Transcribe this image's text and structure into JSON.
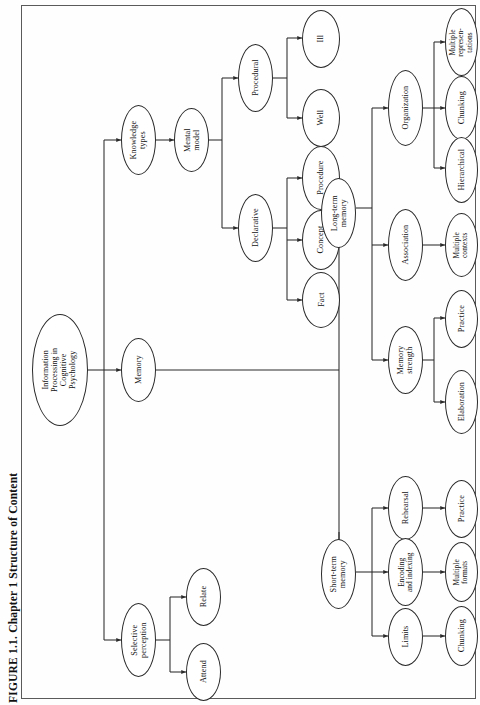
{
  "figure": {
    "caption": "FIGURE 1.1.  Chapter 1 Structure of Content",
    "type": "tree-diagram",
    "orientation": "rotated-90-counterclockwise",
    "node_shape": "ellipse",
    "colors": {
      "stroke": "#2a2a2a",
      "fill": "#ffffff",
      "text": "#111111",
      "plate_border": "#5a5a5a",
      "background": "#fefefe"
    }
  },
  "nodes": {
    "root": "Information\nProcessing in\nCognitive\nPsychology",
    "knowledge_types": "Knowledge\ntypes",
    "memory": "Memory",
    "selective_perception": "Selective\nperception",
    "mental_model": "Mental\nmodel",
    "attend": "Attend",
    "relate": "Relate",
    "procedural": "Procedural",
    "declarative": "Declarative",
    "ill": "Ill",
    "well": "Well",
    "procedure": "Procedure",
    "concept": "Concept",
    "fact": "Fact",
    "long_term_memory": "Long-term\nmemory",
    "short_term_memory": "Short-term\nmemory",
    "organization": "Organization",
    "association": "Association",
    "memory_strength": "Memory\nstrength",
    "multiple_representations": "Multiple\nrepresen-\ntations",
    "chunking_org": "Chunking",
    "hierarchical": "Hierarchical",
    "multiple_contexts": "Multiple\ncontexts",
    "practice_ms": "Practice",
    "elaboration": "Elaboration",
    "rehearsal": "Rehearsal",
    "encoding_and_indexing": "Encoding\nand indexing",
    "limits": "Limits",
    "practice_reh": "Practice",
    "multiple_formats": "Multiple\nformats",
    "chunking_limits": "Chunking"
  },
  "edges": [
    {
      "from": "root",
      "to": "knowledge_types"
    },
    {
      "from": "root",
      "to": "memory"
    },
    {
      "from": "root",
      "to": "selective_perception"
    },
    {
      "from": "knowledge_types",
      "to": "mental_model"
    },
    {
      "from": "mental_model",
      "to": "procedural"
    },
    {
      "from": "mental_model",
      "to": "declarative"
    },
    {
      "from": "procedural",
      "to": "ill"
    },
    {
      "from": "procedural",
      "to": "well"
    },
    {
      "from": "declarative",
      "to": "procedure"
    },
    {
      "from": "declarative",
      "to": "concept"
    },
    {
      "from": "declarative",
      "to": "fact"
    },
    {
      "from": "memory",
      "to": "long_term_memory"
    },
    {
      "from": "memory",
      "to": "short_term_memory"
    },
    {
      "from": "long_term_memory",
      "to": "organization"
    },
    {
      "from": "long_term_memory",
      "to": "association"
    },
    {
      "from": "long_term_memory",
      "to": "memory_strength"
    },
    {
      "from": "organization",
      "to": "multiple_representations"
    },
    {
      "from": "organization",
      "to": "chunking_org"
    },
    {
      "from": "organization",
      "to": "hierarchical"
    },
    {
      "from": "association",
      "to": "multiple_contexts"
    },
    {
      "from": "memory_strength",
      "to": "practice_ms"
    },
    {
      "from": "memory_strength",
      "to": "elaboration"
    },
    {
      "from": "short_term_memory",
      "to": "rehearsal"
    },
    {
      "from": "short_term_memory",
      "to": "encoding_and_indexing"
    },
    {
      "from": "short_term_memory",
      "to": "limits"
    },
    {
      "from": "rehearsal",
      "to": "practice_reh"
    },
    {
      "from": "encoding_and_indexing",
      "to": "multiple_formats"
    },
    {
      "from": "limits",
      "to": "chunking_limits"
    },
    {
      "from": "selective_perception",
      "to": "attend"
    },
    {
      "from": "selective_perception",
      "to": "relate"
    }
  ]
}
